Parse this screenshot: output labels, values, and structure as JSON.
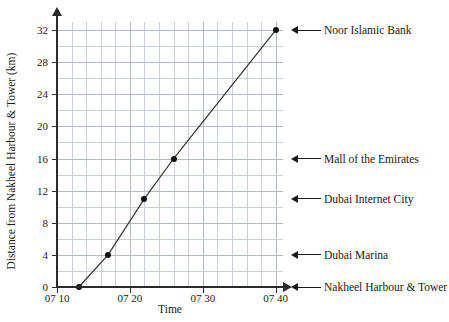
{
  "chart_data": {
    "type": "line",
    "title": "",
    "xlabel": "Time",
    "ylabel": "Distance from Nakheel Harbour & Tower (km)",
    "x": [
      "07 13",
      "07 17",
      "07 22",
      "07 26",
      "07 40"
    ],
    "x_minutes": [
      13,
      17,
      22,
      26,
      40
    ],
    "values": [
      0,
      4,
      11,
      16,
      32
    ],
    "xlim": [
      10,
      41
    ],
    "ylim": [
      0,
      33
    ],
    "xticks": [
      "07 10",
      "07 20",
      "07 30",
      "07 40"
    ],
    "xtick_minutes": [
      10,
      20,
      30,
      40
    ],
    "yticks": [
      0,
      4,
      8,
      12,
      16,
      20,
      24,
      28,
      32
    ],
    "y_minor_step": 2,
    "x_minor_step": 2,
    "grid": true,
    "legend": "none",
    "marker": "filled-circle",
    "line_color": "#333333",
    "grid_color": "#c9cfe0",
    "annotations": [
      {
        "label": "Noor Islamic Bank",
        "value": 32
      },
      {
        "label": "Mall of the Emirates",
        "value": 16
      },
      {
        "label": "Dubai Internet City",
        "value": 11
      },
      {
        "label": "Dubai Marina",
        "value": 4
      },
      {
        "label": "Nakheel Harbour & Tower",
        "value": 0
      }
    ]
  }
}
